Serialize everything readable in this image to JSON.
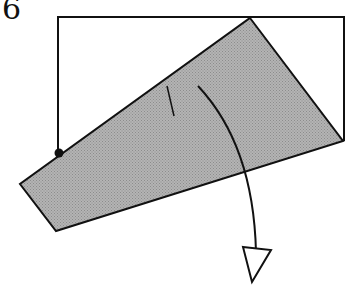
{
  "diagram": {
    "step_number": "6",
    "type": "origami-fold-step",
    "colors": {
      "outline": "#111111",
      "folded_flap_fill": "#a6a6a6",
      "paper_fill": "#ffffff"
    },
    "elements": [
      "square paper outline (partially covered)",
      "shaded folded flap",
      "reference dot on left edge",
      "short crease mark",
      "curved fold arrow with open arrowhead"
    ]
  }
}
